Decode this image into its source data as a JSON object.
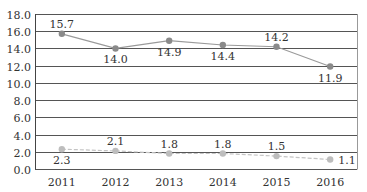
{
  "chart_data": {
    "type": "line",
    "title": "",
    "xlabel": "",
    "ylabel": "",
    "categories": [
      "2011",
      "2012",
      "2013",
      "2014",
      "2015",
      "2016"
    ],
    "ylim": [
      0,
      18
    ],
    "yticks": [
      "0.0",
      "2.0",
      "4.0",
      "6.0",
      "8.0",
      "10.0",
      "12.0",
      "14.0",
      "16.0",
      "18.0"
    ],
    "grid": true,
    "legend": null,
    "series": [
      {
        "name": "series-1",
        "values": [
          15.7,
          14.0,
          14.9,
          14.4,
          14.2,
          11.9
        ],
        "labels": [
          "15.7",
          "14.0",
          "14.9",
          "14.4",
          "14.2",
          "11.9"
        ],
        "line_style": "solid",
        "line_color": "#9a9a9a",
        "marker_color": "#8a8a8a"
      },
      {
        "name": "series-2",
        "values": [
          2.3,
          2.1,
          1.8,
          1.8,
          1.5,
          1.1
        ],
        "labels": [
          "2.3",
          "2.1",
          "1.8",
          "1.8",
          "1.5",
          "1.1"
        ],
        "line_style": "dashed",
        "line_color": "#c4c4c4",
        "marker_color": "#bdbdbd"
      }
    ]
  },
  "colors": {
    "gridline": "#555555",
    "axis": "#444444",
    "text": "#333333"
  }
}
